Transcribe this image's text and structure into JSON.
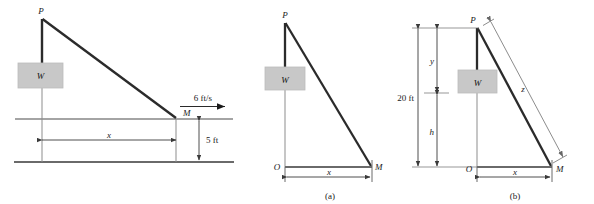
{
  "figure": {
    "colors": {
      "stroke": "#3a3a3a",
      "thick_stroke": "#2b2b2b",
      "thin_stroke": "#777777",
      "weight_box_fill": "#c8c8c8",
      "weight_box_stroke": "#b5b5b5",
      "background": "#ffffff",
      "text": "#1a1a1a"
    },
    "panels": [
      {
        "id": "panel-main",
        "caption": "",
        "labels": {
          "pulley": "P",
          "mass": "M",
          "weight": "W",
          "horizontal_distance": "x",
          "vertical_distance": "5 ft",
          "velocity": "6 ft/s"
        }
      },
      {
        "id": "panel-a",
        "caption": "(a)",
        "labels": {
          "pulley": "P",
          "mass": "M",
          "origin": "O",
          "weight": "W",
          "horizontal_distance": "x"
        }
      },
      {
        "id": "panel-b",
        "caption": "(b)",
        "labels": {
          "pulley": "P",
          "mass": "M",
          "origin": "O",
          "weight": "W",
          "horizontal_distance": "x",
          "total_height": "20 ft",
          "upper_segment": "y",
          "lower_segment": "h",
          "hypotenuse": "z"
        }
      }
    ]
  }
}
